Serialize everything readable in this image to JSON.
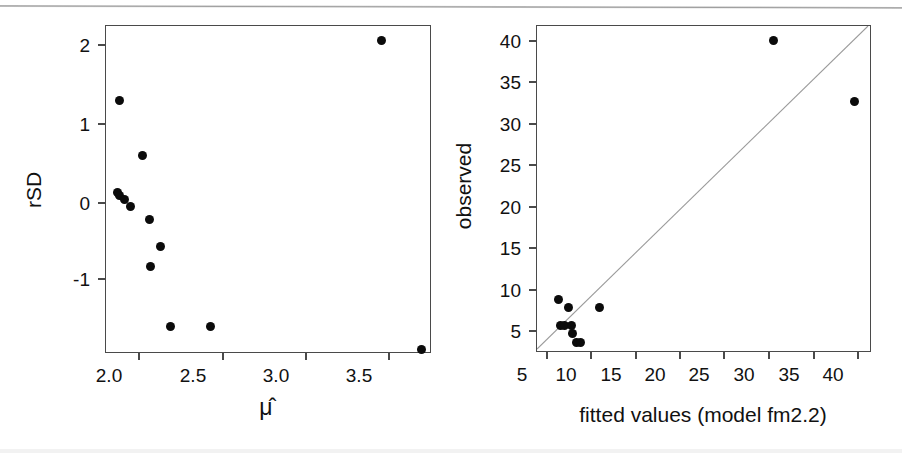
{
  "figure": {
    "type": "scatter-pair",
    "background": "#ffffff",
    "point_color": "#0b0b0b",
    "axis_color": "#4a4a4a",
    "refline_color": "#9a9a9a"
  },
  "panels": [
    {
      "id": "left",
      "name": "residual-sd-vs-mu",
      "xlabel": "μ̂",
      "ylabel": "rSD",
      "x_ticks": [
        "2.0",
        "2.5",
        "3.0",
        "3.5"
      ],
      "y_ticks": [
        "2",
        "1",
        "0",
        "-1"
      ]
    },
    {
      "id": "right",
      "name": "observed-vs-fitted",
      "xlabel": "fitted values (model fm2.2)",
      "ylabel": "observed",
      "x_ticks": [
        "5",
        "10",
        "15",
        "20",
        "25",
        "30",
        "35",
        "40"
      ],
      "y_ticks": [
        "40",
        "35",
        "30",
        "25",
        "20",
        "15",
        "10",
        "5"
      ]
    }
  ],
  "chart_data": [
    {
      "type": "scatter",
      "panel": "left",
      "title": "",
      "xlabel": "μ̂",
      "ylabel": "rSD",
      "xlim": [
        1.77,
        3.72
      ],
      "ylim": [
        -1.75,
        2.25
      ],
      "xticks": [
        2.0,
        2.5,
        3.0,
        3.5
      ],
      "yticks": [
        -1,
        0,
        1,
        2
      ],
      "grid": false,
      "legend": null,
      "x": [
        1.85,
        1.84,
        1.85,
        1.88,
        1.92,
        1.99,
        2.03,
        2.1,
        2.04,
        2.16,
        2.4,
        3.43,
        3.67
      ],
      "y": [
        1.33,
        0.21,
        0.17,
        0.12,
        0.03,
        0.66,
        -0.12,
        -0.46,
        -0.7,
        -1.44,
        -1.44,
        2.07,
        -1.72
      ]
    },
    {
      "type": "scatter",
      "panel": "right",
      "title": "",
      "xlabel": "fitted values (model fm2.2)",
      "ylabel": "observed",
      "xlim": [
        4.0,
        41.5
      ],
      "ylim": [
        4.0,
        41.5
      ],
      "xticks": [
        5,
        10,
        15,
        20,
        25,
        30,
        35,
        40
      ],
      "yticks": [
        5,
        10,
        15,
        20,
        25,
        30,
        35,
        40
      ],
      "grid": false,
      "legend": null,
      "reference_line": {
        "type": "identity",
        "slope": 1,
        "intercept": 0
      },
      "x": [
        6.4,
        7.5,
        6.7,
        7.1,
        7.9,
        8.0,
        8.5,
        8.9,
        11.0,
        30.6,
        39.8
      ],
      "y": [
        10.0,
        9.0,
        7.0,
        7.0,
        7.0,
        6.0,
        5.0,
        5.0,
        9.0,
        39.8,
        32.8
      ]
    }
  ]
}
